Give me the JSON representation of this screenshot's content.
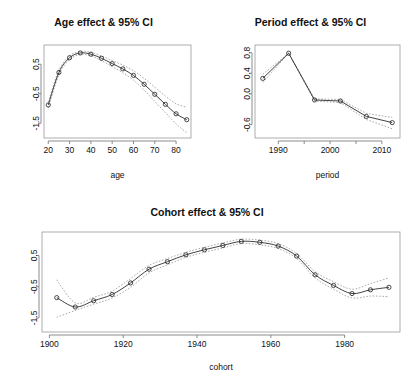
{
  "figure": {
    "background": "#ffffff",
    "line_color": "#2b2b2b",
    "ci_color": "#8d8d8d",
    "axis_color": "#6f6f6f"
  },
  "chart_data": [
    {
      "id": "age",
      "type": "line",
      "title": "Age effect & 95% CI",
      "xlabel": "age",
      "ylabel": "",
      "xlim": [
        18,
        87
      ],
      "ylim": [
        -2.0,
        1.15
      ],
      "xticks": [
        20,
        30,
        40,
        50,
        60,
        70,
        80
      ],
      "yticks": [
        -1.5,
        -0.5,
        0.5
      ],
      "grid": false,
      "legend": null,
      "x": [
        20,
        25,
        30,
        35,
        40,
        45,
        50,
        55,
        60,
        65,
        70,
        75,
        80,
        85
      ],
      "values": [
        -0.88,
        0.22,
        0.72,
        0.88,
        0.84,
        0.7,
        0.52,
        0.34,
        0.12,
        -0.18,
        -0.52,
        -0.86,
        -1.18,
        -1.38
      ],
      "ci_lower": [
        -0.98,
        0.14,
        0.66,
        0.83,
        0.78,
        0.62,
        0.42,
        0.21,
        -0.04,
        -0.38,
        -0.76,
        -1.14,
        -1.52,
        -1.82
      ],
      "ci_upper": [
        -0.78,
        0.3,
        0.78,
        0.93,
        0.9,
        0.78,
        0.62,
        0.47,
        0.28,
        0.02,
        -0.28,
        -0.58,
        -0.84,
        -0.96
      ]
    },
    {
      "id": "period",
      "type": "line",
      "title": "Period effect & 95% CI",
      "xlabel": "period",
      "ylabel": "",
      "xlim": [
        1985.5,
        2013.5
      ],
      "ylim": [
        -0.86,
        0.95
      ],
      "xticks": [
        1990,
        1995,
        2000,
        2005,
        2010
      ],
      "xticklabels": [
        "1990",
        "",
        "2000",
        "",
        "2010"
      ],
      "yticks": [
        -0.6,
        0.0,
        0.4,
        0.8
      ],
      "grid": false,
      "legend": null,
      "x": [
        1987,
        1992,
        1997,
        2002,
        2007,
        2012
      ],
      "values": [
        0.3,
        0.79,
        -0.12,
        -0.14,
        -0.44,
        -0.56
      ],
      "ci_lower": [
        0.22,
        0.79,
        -0.14,
        -0.17,
        -0.5,
        -0.68
      ],
      "ci_upper": [
        0.38,
        0.79,
        -0.1,
        -0.11,
        -0.38,
        -0.46
      ]
    },
    {
      "id": "cohort",
      "type": "line",
      "title": "Cohort effect & 95% CI",
      "xlabel": "cohort",
      "ylabel": "",
      "xlim": [
        1898,
        1995
      ],
      "ylim": [
        -1.95,
        1.25
      ],
      "xticks": [
        1900,
        1920,
        1940,
        1960,
        1980
      ],
      "yticks": [
        -1.5,
        -0.5,
        0.5
      ],
      "grid": false,
      "legend": null,
      "x": [
        1902,
        1907,
        1912,
        1917,
        1922,
        1927,
        1932,
        1937,
        1942,
        1947,
        1952,
        1957,
        1962,
        1967,
        1972,
        1977,
        1982,
        1987,
        1992
      ],
      "values": [
        -0.85,
        -1.15,
        -0.95,
        -0.75,
        -0.38,
        0.06,
        0.3,
        0.52,
        0.68,
        0.82,
        0.95,
        0.92,
        0.8,
        0.48,
        -0.12,
        -0.46,
        -0.72,
        -0.6,
        -0.52
      ],
      "ci_lower": [
        -1.48,
        -1.26,
        -1.06,
        -0.86,
        -0.52,
        -0.06,
        0.2,
        0.44,
        0.6,
        0.74,
        0.88,
        0.84,
        0.72,
        0.4,
        -0.22,
        -0.58,
        -0.86,
        -0.8,
        -0.82
      ],
      "ci_upper": [
        -0.28,
        -1.02,
        -0.84,
        -0.64,
        -0.24,
        0.18,
        0.4,
        0.6,
        0.76,
        0.9,
        1.02,
        0.99,
        0.88,
        0.56,
        -0.02,
        -0.34,
        -0.58,
        -0.4,
        -0.22
      ]
    }
  ]
}
